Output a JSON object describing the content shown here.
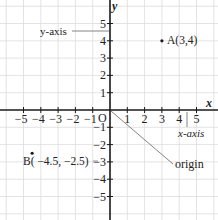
{
  "diagram": {
    "origin_px": {
      "x": 110,
      "y": 110
    },
    "unit_px": 17.3,
    "range": {
      "xmin": -6,
      "xmax": 6,
      "ymin": -6,
      "ymax": 6
    },
    "colors": {
      "grid": "#dcdcdc",
      "axis": "#1a1a1a",
      "text": "#222222",
      "leader": "#777777"
    },
    "axes": {
      "x_label": "x",
      "y_label": "y",
      "origin_label": "O",
      "x_ticks": [
        -5,
        -4,
        -3,
        -2,
        -1,
        1,
        2,
        3,
        4,
        5
      ],
      "y_ticks": [
        -5,
        -4,
        -3,
        -2,
        -1,
        1,
        2,
        3,
        4,
        5
      ],
      "x_tick_labels": [
        "−5",
        "−4",
        "−3",
        "−2",
        "−1",
        "1",
        "2",
        "3",
        "4",
        "5"
      ],
      "y_tick_labels": [
        "−5",
        "−4",
        "−3",
        "−2",
        "−1",
        "1",
        "2",
        "3",
        "4",
        "5"
      ]
    },
    "points": [
      {
        "id": "A",
        "x": 3,
        "y": 4,
        "label": "A(3,4)"
      },
      {
        "id": "B",
        "x": -4.5,
        "y": -2.5,
        "label": "B( −4.5, −2.5)"
      }
    ],
    "annotations": [
      {
        "id": "y-axis",
        "text": "y-axis"
      },
      {
        "id": "x-axis",
        "text": "x-axis"
      },
      {
        "id": "origin",
        "text": "origin"
      }
    ]
  }
}
